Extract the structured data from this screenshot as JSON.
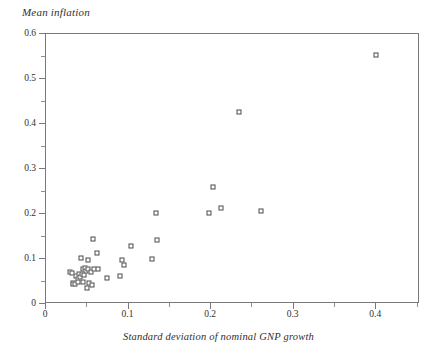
{
  "chart_data": {
    "type": "scatter",
    "title": "Mean inflation",
    "subtitle": "",
    "xlabel": "Standard deviation of nominal GNP growth",
    "ylabel": "Mean inflation",
    "xlim": [
      0,
      0.453
    ],
    "ylim": [
      0,
      0.6
    ],
    "grid": false,
    "legend": null,
    "marker": "open-square",
    "xticks": [
      0,
      0.1,
      0.2,
      0.3,
      0.4
    ],
    "xtick_labels": [
      "0",
      "0.1",
      "0.2",
      "0.3",
      "0.4"
    ],
    "xminor_ticks": [
      0.05,
      0.15,
      0.25,
      0.35,
      0.45
    ],
    "yticks": [
      0,
      0.1,
      0.2,
      0.3,
      0.4,
      0.5,
      0.6
    ],
    "ytick_labels": [
      "0",
      "0.1",
      "0.2",
      "0.3",
      "0.4",
      "0.5",
      "0.6"
    ],
    "yminor_ticks": [
      0.05,
      0.15,
      0.25,
      0.35,
      0.45,
      0.55
    ],
    "points": [
      {
        "x": 0.0305,
        "y": 0.0685
      },
      {
        "x": 0.0325,
        "y": 0.0675
      },
      {
        "x": 0.0335,
        "y": 0.0455
      },
      {
        "x": 0.0345,
        "y": 0.0425
      },
      {
        "x": 0.0365,
        "y": 0.0425
      },
      {
        "x": 0.0375,
        "y": 0.06
      },
      {
        "x": 0.0395,
        "y": 0.053
      },
      {
        "x": 0.0405,
        "y": 0.047
      },
      {
        "x": 0.0415,
        "y": 0.0655
      },
      {
        "x": 0.0425,
        "y": 0.057
      },
      {
        "x": 0.0435,
        "y": 0.1005
      },
      {
        "x": 0.0445,
        "y": 0.0645
      },
      {
        "x": 0.0455,
        "y": 0.0745
      },
      {
        "x": 0.0465,
        "y": 0.047
      },
      {
        "x": 0.0475,
        "y": 0.0615
      },
      {
        "x": 0.0485,
        "y": 0.0775
      },
      {
        "x": 0.0495,
        "y": 0.0705
      },
      {
        "x": 0.0505,
        "y": 0.0325
      },
      {
        "x": 0.0515,
        "y": 0.0745
      },
      {
        "x": 0.0525,
        "y": 0.0945
      },
      {
        "x": 0.0535,
        "y": 0.044
      },
      {
        "x": 0.0555,
        "y": 0.069
      },
      {
        "x": 0.0575,
        "y": 0.04
      },
      {
        "x": 0.0585,
        "y": 0.1415
      },
      {
        "x": 0.0595,
        "y": 0.076
      },
      {
        "x": 0.0625,
        "y": 0.112
      },
      {
        "x": 0.0645,
        "y": 0.0755
      },
      {
        "x": 0.0745,
        "y": 0.0545
      },
      {
        "x": 0.0905,
        "y": 0.059
      },
      {
        "x": 0.0935,
        "y": 0.0945
      },
      {
        "x": 0.0955,
        "y": 0.084
      },
      {
        "x": 0.1045,
        "y": 0.1265
      },
      {
        "x": 0.13,
        "y": 0.0975
      },
      {
        "x": 0.134,
        "y": 0.2
      },
      {
        "x": 0.1355,
        "y": 0.1395
      },
      {
        "x": 0.1985,
        "y": 0.2005
      },
      {
        "x": 0.204,
        "y": 0.257
      },
      {
        "x": 0.2135,
        "y": 0.2115
      },
      {
        "x": 0.2355,
        "y": 0.424
      },
      {
        "x": 0.262,
        "y": 0.2035
      },
      {
        "x": 0.401,
        "y": 0.552
      }
    ]
  }
}
